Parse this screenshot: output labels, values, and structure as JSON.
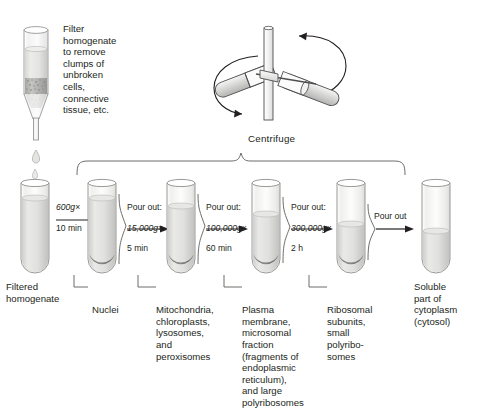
{
  "figure": {
    "type": "differential-centrifugation-diagram",
    "background_color": "#ffffff",
    "ink_color": "#231f20"
  },
  "filter_note": {
    "text": "Filter\nhomogenate\nto remove\nclumps of\nunbroken\ncells,\nconnective\ntissue, etc."
  },
  "centrifuge": {
    "label": "Centrifuge"
  },
  "steps": [
    {
      "id": "step-0",
      "tube_label": "Filtered\nhomogenate",
      "has_pellet": false,
      "fill": "full",
      "arrow": null
    },
    {
      "id": "step-1",
      "tube_label": "Nuclei",
      "has_pellet": true,
      "fill": "full",
      "arrow": {
        "pour": "",
        "speed": "600g",
        "times": "×",
        "duration": "10 min"
      }
    },
    {
      "id": "step-2",
      "tube_label": "Mitochondria,\nchloroplasts,\nlysosomes,\nand\nperoxisomes",
      "has_pellet": true,
      "fill": "high",
      "arrow": {
        "pour": "Pour out:",
        "speed": "15,000g",
        "times": "×",
        "duration": "5 min"
      }
    },
    {
      "id": "step-3",
      "tube_label": "Plasma\nmembrane,\nmicrosomal\nfraction\n(fragments of\nendoplasmic\nreticulum),\nand large\npolyribosomes",
      "has_pellet": true,
      "fill": "mid",
      "arrow": {
        "pour": "Pour out:",
        "speed": "100,000g",
        "times": "×",
        "duration": "60 min"
      }
    },
    {
      "id": "step-4",
      "tube_label": "Ribosomal\nsubunits,\nsmall\npolyribo-\nsomes",
      "has_pellet": true,
      "fill": "low",
      "arrow": {
        "pour": "Pour out:",
        "speed": "300,000g",
        "times": "×",
        "duration": "2 h"
      }
    },
    {
      "id": "step-5",
      "tube_label": "Soluble\npart of\ncytoplasm\n(cytosol)",
      "has_pellet": false,
      "fill": "lowest",
      "arrow": {
        "pour": "Pour out",
        "speed": "",
        "times": "",
        "duration": ""
      }
    }
  ]
}
